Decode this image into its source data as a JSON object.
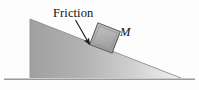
{
  "figure": {
    "background_color": "#fdfdfd",
    "width": 199,
    "height": 90
  },
  "labels": {
    "friction": "Friction",
    "mass": "M"
  },
  "incline": {
    "name": "inclined-plane-wedge",
    "apex": {
      "x": 30,
      "y": 19
    },
    "base_left": {
      "x": 30,
      "y": 78
    },
    "base_right": {
      "x": 181,
      "y": 78
    },
    "angle_degrees": 21,
    "fill_dark": "#a3a3a3",
    "fill_light": "#efefef",
    "edge_color": "#8c8c8c"
  },
  "ground": {
    "name": "ground-line",
    "x_start": 4,
    "x_end": 195,
    "y": 79,
    "color": "#9a9a9a"
  },
  "block": {
    "name": "mass-block",
    "center": {
      "x": 105,
      "y": 38
    },
    "size": 24,
    "rotation_degrees": 21,
    "fill": "#b5b5b5",
    "stroke": "#5d5d5d"
  },
  "arrow": {
    "name": "friction-pointer-arrow",
    "from": {
      "x": 76,
      "y": 19
    },
    "to": {
      "x": 90,
      "y": 45
    },
    "color": "#1a1a1a"
  }
}
